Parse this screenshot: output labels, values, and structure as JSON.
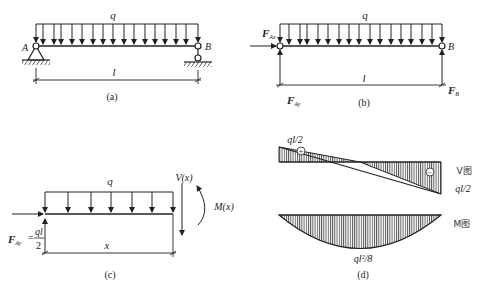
{
  "figure": {
    "panels": {
      "a": {
        "caption": "(a)",
        "load_label": "q",
        "support_left_label": "A",
        "support_right_label": "B",
        "span_label": "l"
      },
      "b": {
        "caption": "(b)",
        "load_label": "q",
        "right_label": "B",
        "span_label": "l",
        "force_ax_main": "F",
        "force_ax_sub": "Ax",
        "force_ay_main": "F",
        "force_ay_sub": "Ay",
        "force_b_main": "F",
        "force_b_sub": "B"
      },
      "c": {
        "caption": "(c)",
        "load_label": "q",
        "length_label": "x",
        "shear_label": "V(x)",
        "moment_label": "M(x)",
        "force_ay_main": "F",
        "force_ay_sub": "Ay",
        "force_ay_eq": "=",
        "force_ay_num": "ql",
        "force_ay_den": "2"
      },
      "d": {
        "caption": "(d)",
        "shear_max_label": "ql/2",
        "shear_min_label": "ql/2",
        "shear_diagram_label": "V图",
        "moment_diagram_label": "M图",
        "moment_max_label": "ql²/8",
        "positive_sign": "+",
        "negative_sign": "−"
      }
    }
  }
}
